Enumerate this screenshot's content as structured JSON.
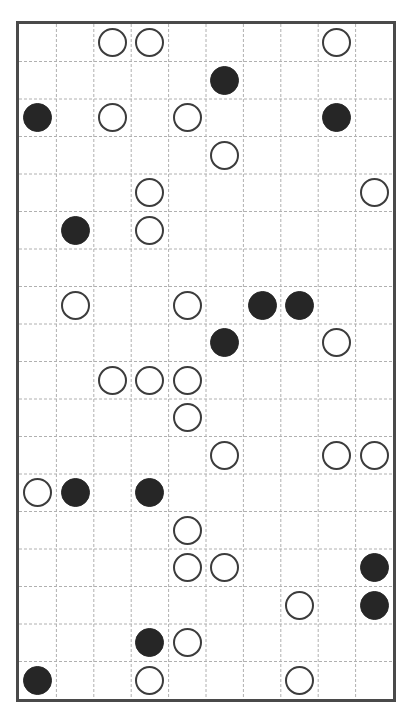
{
  "board": {
    "columns": 10,
    "rows": 18,
    "colors": {
      "border": "#4a4a4a",
      "grid_line": "#b0b0b0",
      "white_stone_fill": "#ffffff",
      "white_stone_outline": "#3c3c3c",
      "black_stone_fill": "#262626",
      "background": "#ffffff"
    },
    "stones": [
      {
        "row": 0,
        "col": 2,
        "color": "white"
      },
      {
        "row": 0,
        "col": 3,
        "color": "white"
      },
      {
        "row": 0,
        "col": 8,
        "color": "white"
      },
      {
        "row": 1,
        "col": 5,
        "color": "black"
      },
      {
        "row": 2,
        "col": 0,
        "color": "black"
      },
      {
        "row": 2,
        "col": 2,
        "color": "white"
      },
      {
        "row": 2,
        "col": 4,
        "color": "white"
      },
      {
        "row": 2,
        "col": 8,
        "color": "black"
      },
      {
        "row": 3,
        "col": 5,
        "color": "white"
      },
      {
        "row": 4,
        "col": 3,
        "color": "white"
      },
      {
        "row": 4,
        "col": 9,
        "color": "white"
      },
      {
        "row": 5,
        "col": 1,
        "color": "black"
      },
      {
        "row": 5,
        "col": 3,
        "color": "white"
      },
      {
        "row": 7,
        "col": 1,
        "color": "white"
      },
      {
        "row": 7,
        "col": 4,
        "color": "white"
      },
      {
        "row": 7,
        "col": 6,
        "color": "black"
      },
      {
        "row": 7,
        "col": 7,
        "color": "black"
      },
      {
        "row": 8,
        "col": 5,
        "color": "black"
      },
      {
        "row": 8,
        "col": 8,
        "color": "white"
      },
      {
        "row": 9,
        "col": 2,
        "color": "white"
      },
      {
        "row": 9,
        "col": 3,
        "color": "white"
      },
      {
        "row": 9,
        "col": 4,
        "color": "white"
      },
      {
        "row": 10,
        "col": 4,
        "color": "white"
      },
      {
        "row": 11,
        "col": 5,
        "color": "white"
      },
      {
        "row": 11,
        "col": 8,
        "color": "white"
      },
      {
        "row": 11,
        "col": 9,
        "color": "white"
      },
      {
        "row": 12,
        "col": 0,
        "color": "white"
      },
      {
        "row": 12,
        "col": 1,
        "color": "black"
      },
      {
        "row": 12,
        "col": 3,
        "color": "black"
      },
      {
        "row": 13,
        "col": 4,
        "color": "white"
      },
      {
        "row": 14,
        "col": 4,
        "color": "white"
      },
      {
        "row": 14,
        "col": 5,
        "color": "white"
      },
      {
        "row": 14,
        "col": 9,
        "color": "black"
      },
      {
        "row": 15,
        "col": 7,
        "color": "white"
      },
      {
        "row": 15,
        "col": 9,
        "color": "black"
      },
      {
        "row": 16,
        "col": 3,
        "color": "black"
      },
      {
        "row": 16,
        "col": 4,
        "color": "white"
      },
      {
        "row": 17,
        "col": 0,
        "color": "black"
      },
      {
        "row": 17,
        "col": 3,
        "color": "white"
      },
      {
        "row": 17,
        "col": 7,
        "color": "white"
      }
    ],
    "counts": {
      "white": 27,
      "black": 13
    }
  }
}
